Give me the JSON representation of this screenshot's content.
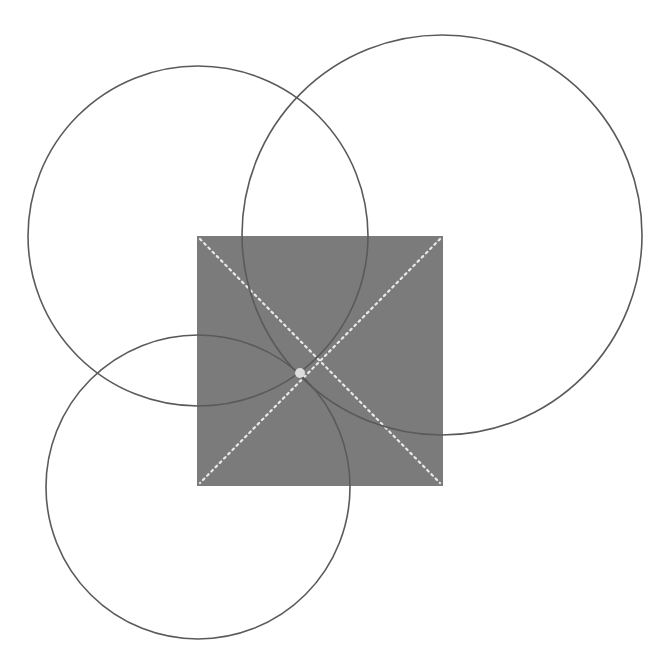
{
  "diagram": {
    "width": 663,
    "height": 670,
    "background": "#ffffff",
    "square": {
      "x": 197,
      "y": 236,
      "width": 246,
      "height": 250,
      "fill": "#7b7b7b"
    },
    "diagonals": [
      {
        "x1": 200,
        "y1": 239,
        "x2": 440,
        "y2": 483
      },
      {
        "x1": 440,
        "y1": 239,
        "x2": 200,
        "y2": 483
      }
    ],
    "diagonal_color": "#e8e8e8",
    "circles": [
      {
        "name": "circle-top-left",
        "cx": 198,
        "cy": 236,
        "r": 170
      },
      {
        "name": "circle-right",
        "cx": 442,
        "cy": 235,
        "r": 200
      },
      {
        "name": "circle-bottom-left",
        "cx": 198,
        "cy": 487,
        "r": 152
      }
    ],
    "circle_stroke": "#5a5a5a",
    "center_point": {
      "cx": 300,
      "cy": 373,
      "r": 5,
      "fill": "#dcdcdc"
    }
  }
}
